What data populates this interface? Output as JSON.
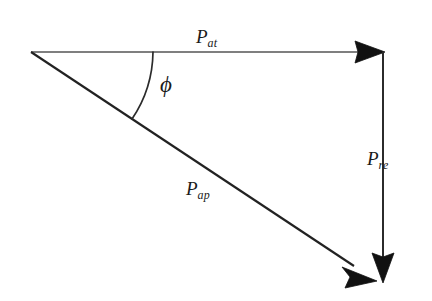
{
  "figure": {
    "name": "power-triangle-vector-diagram",
    "background_color": "#ffffff",
    "stroke_color": "#1a1a1a",
    "thin_stroke_color": "#4a4a4a",
    "width": 432,
    "height": 301
  },
  "vectors": [
    {
      "id": "p-at",
      "label_base": "P",
      "label_sub": "at",
      "description": "horizontal active power vector",
      "from": [
        31,
        52
      ],
      "to": [
        385,
        52
      ],
      "arrowhead": "filled-triangle",
      "label_position": [
        196,
        27
      ]
    },
    {
      "id": "p-re",
      "label_base": "P",
      "label_sub": "re",
      "description": "vertical reactive power vector",
      "from": [
        383,
        52
      ],
      "to": [
        383,
        283
      ],
      "arrowhead": "filled-triangle",
      "label_position": [
        367,
        149
      ]
    },
    {
      "id": "p-ap",
      "label_base": "P",
      "label_sub": "ap",
      "description": "diagonal apparent power vector",
      "from": [
        31,
        52
      ],
      "to": [
        377,
        281
      ],
      "arrowhead": "filled-triangle",
      "label_position": [
        186,
        179
      ]
    }
  ],
  "angle": {
    "id": "phi",
    "symbol": "ϕ",
    "description": "phase angle between active and apparent power vectors",
    "vertex": [
      31,
      52
    ],
    "radius": 122,
    "start_angle_deg": 0,
    "end_angle_deg": 33.5,
    "label_position": [
      160,
      73
    ]
  }
}
